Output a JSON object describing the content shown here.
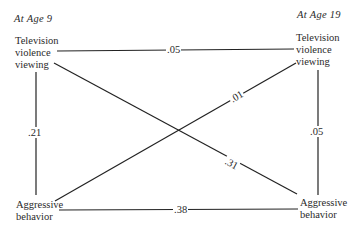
{
  "diagram": {
    "type": "cross-lagged panel correlation diagram",
    "time_labels": {
      "left": "At Age 9",
      "right": "At Age 19"
    },
    "nodes": {
      "tv_9": {
        "lines": [
          "Television",
          "violence",
          "viewing"
        ]
      },
      "agg_9": {
        "lines": [
          "Aggressive",
          "behavior"
        ]
      },
      "tv_19": {
        "lines": [
          "Television",
          "violence",
          "viewing"
        ]
      },
      "agg_19": {
        "lines": [
          "Aggressive",
          "behavior"
        ]
      }
    },
    "edges": [
      {
        "from": "tv_9",
        "to": "tv_19",
        "label": ".05"
      },
      {
        "from": "tv_9",
        "to": "agg_9",
        "label": ".21"
      },
      {
        "from": "tv_19",
        "to": "agg_19",
        "label": ".05"
      },
      {
        "from": "agg_9",
        "to": "tv_19",
        "label": ".01"
      },
      {
        "from": "tv_9",
        "to": "agg_19",
        "label": ".31"
      },
      {
        "from": "agg_9",
        "to": "agg_19",
        "label": ".38"
      }
    ],
    "line_color": "#222222"
  }
}
